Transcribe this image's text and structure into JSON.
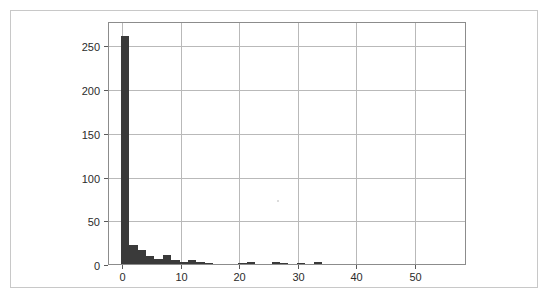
{
  "figure": {
    "background_color": "#ffffff",
    "frame_color": "#c8c8c8",
    "plot_border_color": "#8c8c8c",
    "grid_color": "#b9b9b9",
    "bar_color": "#3a3a3a",
    "title": "",
    "subtitle": ""
  },
  "chart_data": {
    "type": "bar",
    "chart_style": "histogram",
    "title": "",
    "subtitle": "",
    "xlabel": "",
    "ylabel": "",
    "xlim": [
      -2.4,
      58.7
    ],
    "ylim": [
      0,
      278
    ],
    "grid": true,
    "grid_axes": "both",
    "legend": false,
    "legend_position": "none",
    "xticks": [
      0,
      10,
      20,
      30,
      40,
      50
    ],
    "xtick_labels": [
      "0",
      "10",
      "20",
      "30",
      "40",
      "50"
    ],
    "yticks": [
      0,
      50,
      100,
      150,
      200,
      250
    ],
    "ytick_labels": [
      "0",
      "50",
      "100",
      "150",
      "200",
      "250"
    ],
    "bin_width": 1.43,
    "bin_edges": [
      -0.2,
      1.23,
      2.66,
      4.09,
      5.52,
      6.95,
      8.38,
      9.81,
      11.24,
      12.67,
      14.1,
      15.53,
      16.96,
      18.39,
      19.82,
      21.25,
      22.68,
      24.11,
      25.54,
      26.97,
      28.4,
      29.83,
      31.26,
      32.69,
      34.12,
      35.55,
      36.98,
      38.41,
      39.84,
      41.27,
      42.7,
      44.13,
      45.56,
      46.99,
      48.42,
      49.85,
      51.28,
      52.71,
      54.14,
      55.57,
      57.0
    ],
    "values": [
      262,
      23,
      17,
      10,
      7,
      11,
      6,
      4,
      6,
      3,
      2,
      1,
      1,
      1,
      2,
      3,
      1,
      1,
      3,
      2,
      1,
      2,
      1,
      3,
      0,
      0,
      0,
      0,
      0,
      0,
      0,
      0,
      0,
      1,
      0,
      0,
      0,
      0,
      0,
      1
    ],
    "peak_value": 262,
    "peak_bin_center": 0.5,
    "categories": [
      "0.5",
      "1.9",
      "3.4",
      "4.8",
      "6.2",
      "7.7",
      "9.1",
      "10.5",
      "12.0",
      "13.4",
      "14.8",
      "16.2",
      "17.7",
      "19.1",
      "20.5",
      "22.0",
      "23.4",
      "24.8",
      "26.3",
      "27.7",
      "29.1",
      "30.5",
      "32.0",
      "33.4",
      "34.8",
      "36.3",
      "37.7",
      "39.1",
      "40.6",
      "42.0",
      "43.4",
      "44.8",
      "46.3",
      "47.7",
      "49.1",
      "50.6",
      "52.0",
      "53.4",
      "54.9",
      "56.3"
    ]
  },
  "annotations": {
    "stray_mark_present": true
  }
}
